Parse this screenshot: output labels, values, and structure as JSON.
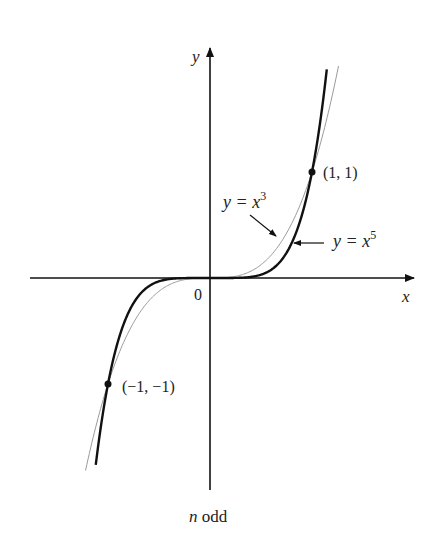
{
  "figure": {
    "caption_var": "n",
    "caption_rest": " odd",
    "axes": {
      "x_label": "x",
      "y_label": "y",
      "origin_label": "0"
    },
    "points": [
      {
        "label": "(1, 1)",
        "x": 1,
        "y": 1
      },
      {
        "label": "(−1, −1)",
        "x": -1,
        "y": -1
      }
    ],
    "curves": [
      {
        "name": "y = x^3",
        "label_main": "y = x",
        "exponent": "3",
        "style": "thin-gray",
        "color": "#9a9a9a"
      },
      {
        "name": "y = x^5",
        "label_main": "y = x",
        "exponent": "5",
        "style": "thick-black",
        "color": "#111111"
      }
    ]
  },
  "chart_data": {
    "type": "line",
    "title": "n odd",
    "xlabel": "x",
    "ylabel": "y",
    "xlim": [
      -1.75,
      1.95
    ],
    "ylim": [
      -2.0,
      2.15
    ],
    "grid": false,
    "series": [
      {
        "name": "y = x^3",
        "function": "x^3",
        "x": [
          -1.26,
          -1.0,
          -0.5,
          0,
          0.5,
          1.0,
          1.26
        ],
        "y": [
          -2.0,
          -1.0,
          -0.125,
          0,
          0.125,
          1.0,
          2.0
        ]
      },
      {
        "name": "y = x^5",
        "function": "x^5",
        "x": [
          -1.15,
          -1.0,
          -0.5,
          0,
          0.5,
          1.0,
          1.15
        ],
        "y": [
          -2.0,
          -1.0,
          -0.031,
          0,
          0.031,
          1.0,
          2.0
        ]
      }
    ],
    "annotations": [
      "(1, 1)",
      "(−1, −1)",
      "0",
      "y = x^3",
      "y = x^5",
      "n odd"
    ]
  }
}
